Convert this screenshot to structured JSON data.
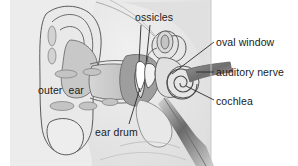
{
  "figure": {
    "panel": {
      "background_color": "#ececec",
      "left": 10,
      "right": 211,
      "top": 0,
      "bottom": 166
    },
    "palette": {
      "outline": "#555555",
      "label_text": "#1a1a1a",
      "leader_line": "#222222",
      "fill_light": "#e3e3e3",
      "fill_mid": "#cfcfcf",
      "fill_dark": "#a8a8a8",
      "fill_darkest": "#8d8d8d",
      "page_background": "#ffffff"
    }
  },
  "labels": {
    "ossicles": "ossicles",
    "oval_window": "oval window",
    "auditory_nerve": "auditory nerve",
    "cochlea": "cochlea",
    "outer_ear": "outer  ear",
    "ear_drum": "ear drum"
  },
  "structures": [
    {
      "name": "pinna",
      "label": "outer  ear"
    },
    {
      "name": "ear-canal",
      "label": "outer  ear"
    },
    {
      "name": "ear-drum",
      "label": "ear drum"
    },
    {
      "name": "ossicles",
      "label": "ossicles"
    },
    {
      "name": "oval-window",
      "label": "oval window"
    },
    {
      "name": "semicircular-canals",
      "label": ""
    },
    {
      "name": "cochlea",
      "label": "cochlea"
    },
    {
      "name": "auditory-nerve",
      "label": "auditory nerve"
    }
  ]
}
